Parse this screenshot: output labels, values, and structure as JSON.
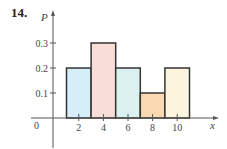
{
  "problem_number": "14.",
  "chart_data": {
    "type": "bar",
    "title": "",
    "xlabel": "x",
    "ylabel": "P",
    "categories": [
      "2",
      "4",
      "6",
      "8",
      "10"
    ],
    "values": [
      0.2,
      0.3,
      0.2,
      0.1,
      0.2
    ],
    "bar_colors": [
      "#d6eef8",
      "#f9ddd8",
      "#daf1f0",
      "#f8d9b0",
      "#fcf4dc"
    ],
    "bar_edge_color": "#333333",
    "x_ticks": [
      "2",
      "4",
      "6",
      "8",
      "10"
    ],
    "y_ticks": [
      "0.1",
      "0.2",
      "0.3"
    ],
    "origin_label": "0",
    "ylim": [
      0,
      0.3
    ],
    "grid": false,
    "legend": null
  }
}
